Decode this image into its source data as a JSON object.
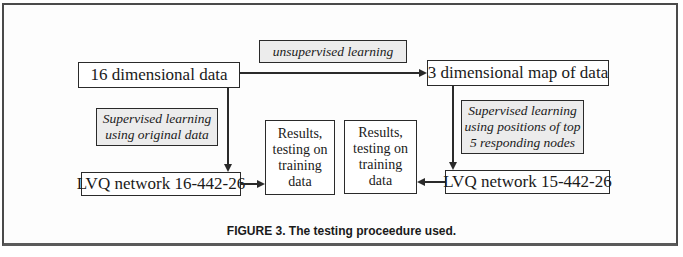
{
  "diagram": {
    "nodes": {
      "unsupervised": {
        "label": "unsupervised learning",
        "style": "shaded-italic"
      },
      "data16": {
        "label": "16 dimensional data"
      },
      "map3": {
        "label": "3 dimensional map of data"
      },
      "sup_original": {
        "lines": [
          "Supervised learning",
          "using original data"
        ],
        "style": "shaded-italic"
      },
      "lvq16": {
        "label": "LVQ network 16-442-26"
      },
      "results1": {
        "lines": [
          "Results,",
          "testing on",
          "training",
          "data"
        ]
      },
      "results2": {
        "lines": [
          "Results,",
          "testing on",
          "training",
          "data"
        ]
      },
      "lvq15": {
        "label": "LVQ network 15-442-26"
      },
      "sup_positions": {
        "lines": [
          "Supervised learning",
          "using positions of top",
          "5 responding nodes"
        ],
        "style": "shaded-italic"
      }
    },
    "edges": [
      {
        "from": "16 dimensional data",
        "to": "3 dimensional map of data",
        "label": "unsupervised learning"
      },
      {
        "from": "16 dimensional data",
        "to": "LVQ network 16-442-26",
        "label": "Supervised learning using original data"
      },
      {
        "from": "LVQ network 16-442-26",
        "to": "Results, testing on training data (left)"
      },
      {
        "from": "3 dimensional map of data",
        "to": "LVQ network 15-442-26",
        "label": "Supervised learning using positions of top 5 responding nodes"
      },
      {
        "from": "LVQ network 15-442-26",
        "to": "Results, testing on training data (right)"
      }
    ],
    "caption": "FIGURE 3. The testing proceedure used."
  }
}
